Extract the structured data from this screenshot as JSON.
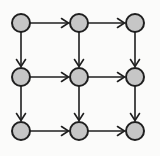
{
  "diagram": {
    "type": "directed-grid-graph",
    "canvas": {
      "width": 160,
      "height": 156,
      "background": "#fbfbfa"
    },
    "node_style": {
      "fill": "#c6c6c6",
      "stroke": "#1f1f1f",
      "stroke_width": 2,
      "radius": 9
    },
    "edge_style": {
      "stroke": "#1f1f1f",
      "stroke_width": 1.6,
      "arrowhead": "open-v",
      "arrow_length": 7,
      "arrow_half_width": 4.5
    },
    "grid": {
      "rows": 3,
      "cols": 3
    },
    "nodes": [
      {
        "id": "n00",
        "row": 0,
        "col": 0,
        "x": 21,
        "y": 23
      },
      {
        "id": "n01",
        "row": 0,
        "col": 1,
        "x": 79,
        "y": 23
      },
      {
        "id": "n02",
        "row": 0,
        "col": 2,
        "x": 135,
        "y": 23
      },
      {
        "id": "n10",
        "row": 1,
        "col": 0,
        "x": 21,
        "y": 77
      },
      {
        "id": "n11",
        "row": 1,
        "col": 1,
        "x": 79,
        "y": 77
      },
      {
        "id": "n12",
        "row": 1,
        "col": 2,
        "x": 135,
        "y": 77
      },
      {
        "id": "n20",
        "row": 2,
        "col": 0,
        "x": 21,
        "y": 131
      },
      {
        "id": "n21",
        "row": 2,
        "col": 1,
        "x": 79,
        "y": 131
      },
      {
        "id": "n22",
        "row": 2,
        "col": 2,
        "x": 135,
        "y": 131
      }
    ],
    "edges": [
      {
        "from": "n00",
        "to": "n01",
        "direction": "right"
      },
      {
        "from": "n01",
        "to": "n02",
        "direction": "right"
      },
      {
        "from": "n10",
        "to": "n11",
        "direction": "right"
      },
      {
        "from": "n11",
        "to": "n12",
        "direction": "right"
      },
      {
        "from": "n20",
        "to": "n21",
        "direction": "right"
      },
      {
        "from": "n21",
        "to": "n22",
        "direction": "right"
      },
      {
        "from": "n00",
        "to": "n10",
        "direction": "down"
      },
      {
        "from": "n10",
        "to": "n20",
        "direction": "down"
      },
      {
        "from": "n01",
        "to": "n11",
        "direction": "down"
      },
      {
        "from": "n11",
        "to": "n21",
        "direction": "down"
      },
      {
        "from": "n02",
        "to": "n12",
        "direction": "down"
      },
      {
        "from": "n12",
        "to": "n22",
        "direction": "down"
      }
    ]
  }
}
